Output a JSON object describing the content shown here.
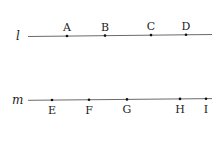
{
  "diagram": {
    "lines": [
      {
        "name": "l",
        "x1": 28,
        "y1": 36.5,
        "x2": 212,
        "y2": 34.5,
        "label_x": 16,
        "label_y": 40,
        "label_position": "above",
        "points": [
          {
            "label": "A",
            "x": 67,
            "y": 36
          },
          {
            "label": "B",
            "x": 105,
            "y": 35.6
          },
          {
            "label": "C",
            "x": 151,
            "y": 35.1
          },
          {
            "label": "D",
            "x": 186,
            "y": 34.8
          }
        ]
      },
      {
        "name": "m",
        "x1": 28,
        "y1": 100.3,
        "x2": 212,
        "y2": 98.6,
        "label_x": 12,
        "label_y": 104,
        "label_position": "below",
        "points": [
          {
            "label": "E",
            "x": 52,
            "y": 100
          },
          {
            "label": "F",
            "x": 89,
            "y": 99.7
          },
          {
            "label": "G",
            "x": 127,
            "y": 99.4
          },
          {
            "label": "H",
            "x": 180,
            "y": 98.9
          },
          {
            "label": "I",
            "x": 206,
            "y": 98.7
          }
        ]
      }
    ],
    "colors": {
      "line": "#444444",
      "point": "#111111",
      "text": "#222222"
    }
  }
}
